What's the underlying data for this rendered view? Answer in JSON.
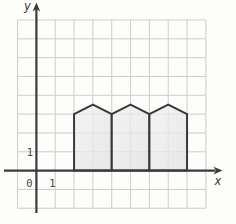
{
  "figure": {
    "title_hint": "coordinate-grid with three house-shaped pentagons on the x-axis",
    "background_color": "#fdfdfc",
    "grid": {
      "color": "#cbcecb",
      "stroke_width": 1,
      "unit_px": 18.83,
      "origin_px": {
        "x": 36.4,
        "y": 170.6
      },
      "x_range": [
        -1,
        9
      ],
      "y_range": [
        -2,
        8
      ]
    },
    "axes": {
      "color": "#3b3b3b",
      "stroke_width": 2.2,
      "x_axis": {
        "y_units": 0,
        "from_px": 4,
        "to_px": 215.5,
        "arrow_tip_px": 222.5
      },
      "y_axis": {
        "x_units": 0,
        "from_px": 213,
        "to_px": 9,
        "arrow_tip_px": 2.5
      }
    },
    "labels": {
      "y_axis": "y",
      "x_axis": "x",
      "origin": "0",
      "x_tick": "1",
      "y_tick": "1"
    },
    "shapes": {
      "stroke": "#3a3a3a",
      "stroke_width": 2,
      "fill_gradient": [
        "#f1f1f2",
        "#e1e1e4"
      ],
      "fill_opacity": 0.78,
      "houses": [
        {
          "points_units": [
            [
              2,
              0
            ],
            [
              2,
              3
            ],
            [
              3,
              3.5
            ],
            [
              4,
              3
            ],
            [
              4,
              0
            ]
          ]
        },
        {
          "points_units": [
            [
              4,
              0
            ],
            [
              4,
              3
            ],
            [
              5,
              3.5
            ],
            [
              6,
              3
            ],
            [
              6,
              0
            ]
          ]
        },
        {
          "points_units": [
            [
              6,
              0
            ],
            [
              6,
              3
            ],
            [
              7,
              3.5
            ],
            [
              8,
              3
            ],
            [
              8,
              0
            ]
          ]
        }
      ]
    }
  }
}
